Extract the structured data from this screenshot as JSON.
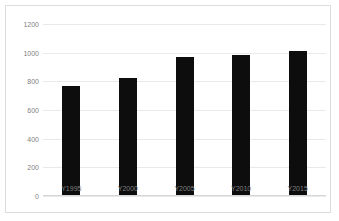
{
  "chart_data": {
    "type": "bar",
    "title": "",
    "subtitle": "",
    "xlabel": "",
    "ylabel": "",
    "categories": [
      "Y1995",
      "Y2000",
      "Y2005",
      "Y2010",
      "Y2015"
    ],
    "values": [
      765,
      825,
      970,
      985,
      1015
    ],
    "series": [
      {
        "name": "",
        "values": [
          765,
          825,
          970,
          985,
          1015
        ]
      }
    ],
    "ylim": [
      0,
      1200
    ],
    "yticks": [
      0,
      200,
      400,
      600,
      800,
      1000,
      1200
    ],
    "ytick_labels": [
      "0",
      "200",
      "400",
      "600",
      "800",
      "1000",
      "1200"
    ],
    "grid": true,
    "legend": false,
    "legend_position": "none",
    "bar_color": "#0d0d0d",
    "gridline_color": "#e9e9e9",
    "axis_label_color": "#7f7f7f",
    "frame_color": "#dcdcdc",
    "background_color": "#ffffff"
  }
}
